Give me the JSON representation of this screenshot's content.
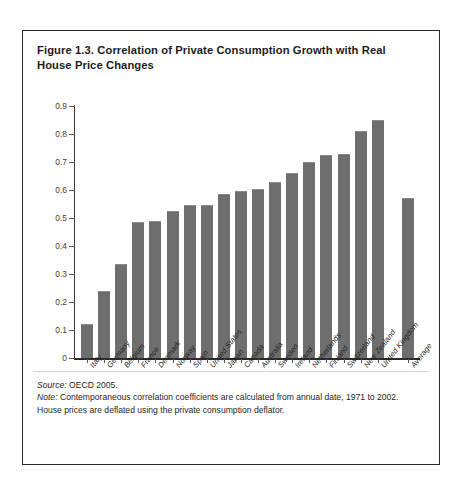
{
  "figure": {
    "title": "Figure 1.3. Correlation of Private Consumption Growth with Real House Price Changes",
    "source_label": "Source:",
    "source_text": " OECD 2005.",
    "note_label": "Note:",
    "note_text": " Contemporaneous correlation coefficients are calculated from annual date, 1971 to 2002.",
    "note_line2": "House prices are deflated using the private consumption deflator."
  },
  "colors": {
    "bar": "#6e6e6e",
    "axis": "#2b2b2b",
    "border": "#2b2b2b",
    "text": "#1c1c1c"
  },
  "chart_data": {
    "type": "bar",
    "title": "Figure 1.3. Correlation of Private Consumption Growth with Real House Price Changes",
    "xlabel": "",
    "ylabel": "",
    "ylim": [
      0,
      0.9
    ],
    "grid": false,
    "legend": null,
    "ytick_labels": [
      "0.9",
      "0.8",
      "0.7",
      "0.6",
      "0.5",
      "0.4",
      "0.3",
      "0.2",
      "0.1",
      "0"
    ],
    "ytick_values": [
      0.9,
      0.8,
      0.7,
      0.6,
      0.5,
      0.4,
      0.3,
      0.2,
      0.1,
      0
    ],
    "categories": [
      "Italy",
      "Germany",
      "Belgium",
      "France",
      "Denmark",
      "Norway",
      "Spain",
      "United States",
      "Japan",
      "Canada",
      "Australia",
      "Sweden",
      "Ireland",
      "Netherlands",
      "Finland",
      "Switzerland",
      "New Zealand",
      "United Kingdom",
      "Average"
    ],
    "values": [
      0.12,
      0.24,
      0.335,
      0.485,
      0.49,
      0.525,
      0.545,
      0.545,
      0.585,
      0.595,
      0.605,
      0.63,
      0.66,
      0.7,
      0.725,
      0.73,
      0.81,
      0.85,
      0.57
    ],
    "separated_last_category": true,
    "annotations": [
      "Source: OECD 2005.",
      "Note: Contemporaneous correlation coefficients are calculated from annual date, 1971 to 2002.",
      "House prices are deflated using the private consumption deflator."
    ]
  }
}
